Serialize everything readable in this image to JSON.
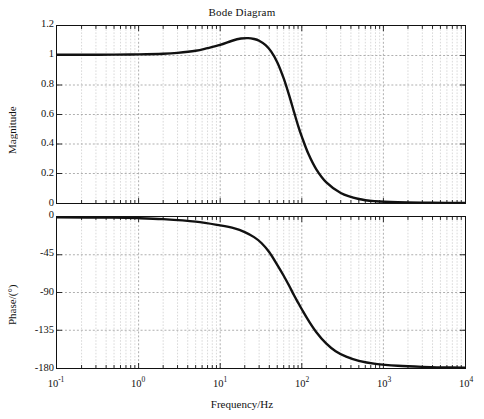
{
  "chart_data": {
    "type": "line",
    "title": "Bode Diagram",
    "xlabel": "Frequency/Hz",
    "xscale": "log",
    "xlim": [
      0.1,
      10000
    ],
    "xticks": [
      {
        "label_base": "10",
        "label_exp": "-1",
        "value": 0.1
      },
      {
        "label_base": "10",
        "label_exp": "0",
        "value": 1
      },
      {
        "label_base": "10",
        "label_exp": "1",
        "value": 10
      },
      {
        "label_base": "10",
        "label_exp": "2",
        "value": 100
      },
      {
        "label_base": "10",
        "label_exp": "3",
        "value": 1000
      },
      {
        "label_base": "10",
        "label_exp": "4",
        "value": 10000
      }
    ],
    "grid": true,
    "legend": null,
    "panels": [
      {
        "name": "magnitude",
        "ylabel": "Magnitude",
        "ylim": [
          0,
          1.2
        ],
        "yticks": [
          "0",
          "0.2",
          "0.4",
          "0.6",
          "0.8",
          "1",
          "1.2"
        ],
        "ytick_values": [
          0,
          0.2,
          0.4,
          0.6,
          0.8,
          1,
          1.2
        ],
        "series": [
          {
            "name": "magnitude-response",
            "color": "#111111",
            "x": [
              0.1,
              0.2,
              0.5,
              1,
              2,
              3,
              5,
              7,
              10,
              14,
              18,
              22,
              26,
              30,
              36,
              42,
              50,
              60,
              70,
              80,
              90,
              100,
              120,
              150,
              200,
              300,
              500,
              800,
              1500,
              3000,
              6000,
              10000
            ],
            "y": [
              1.005,
              1.005,
              1.006,
              1.008,
              1.012,
              1.018,
              1.032,
              1.05,
              1.072,
              1.1,
              1.115,
              1.118,
              1.112,
              1.1,
              1.07,
              1.028,
              0.955,
              0.845,
              0.73,
              0.62,
              0.525,
              0.45,
              0.335,
              0.23,
              0.14,
              0.068,
              0.027,
              0.012,
              0.005,
              0.002,
              0.001,
              0.0005
            ]
          }
        ]
      },
      {
        "name": "phase",
        "ylabel": "Phase/(°)",
        "ylim": [
          -180,
          0
        ],
        "yticks": [
          "-180",
          "-135",
          "-90",
          "-45",
          "0"
        ],
        "ytick_values": [
          -180,
          -135,
          -90,
          -45,
          0
        ],
        "series": [
          {
            "name": "phase-response",
            "color": "#111111",
            "x": [
              0.1,
              0.5,
              1,
              2,
              5,
              10,
              15,
              20,
              26,
              32,
              40,
              50,
              60,
              70,
              80,
              90,
              100,
              120,
              150,
              200,
              260,
              350,
              500,
              800,
              1500,
              3000,
              6000,
              10000
            ],
            "y": [
              -0.3,
              -0.8,
              -1.4,
              -2.6,
              -5.5,
              -10.0,
              -13.5,
              -18.0,
              -24.0,
              -31.0,
              -42.0,
              -57.0,
              -70.0,
              -82.0,
              -93.0,
              -102.0,
              -110.0,
              -123.0,
              -137.0,
              -151.0,
              -160.0,
              -166.5,
              -171.5,
              -175.0,
              -177.3,
              -178.6,
              -179.3,
              -179.6
            ]
          }
        ]
      }
    ]
  },
  "chart": {
    "title": "Bode Diagram",
    "xlabel": "Frequency/Hz",
    "mag_ylabel": "Magnitude",
    "pha_ylabel": "Phase/(°)"
  },
  "colors": {
    "curve": "#111111",
    "axis": "#111111",
    "grid_major": "#9a9a9a",
    "grid_minor": "#c8c8c8",
    "background": "#ffffff"
  }
}
